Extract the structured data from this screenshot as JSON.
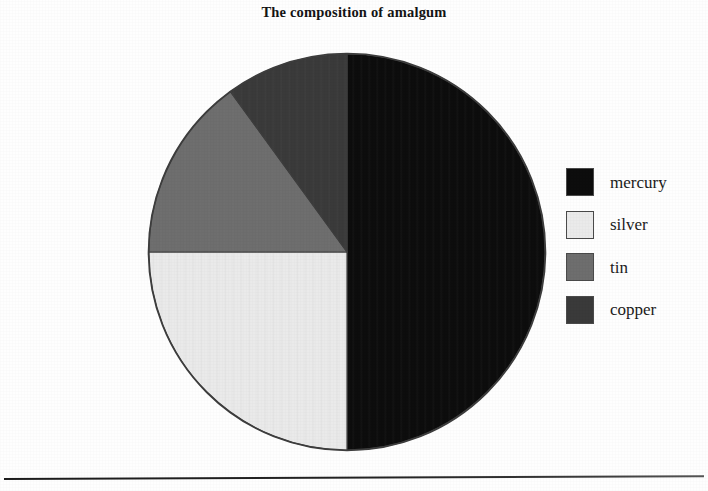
{
  "title": "The composition of amalgum",
  "chart_data": {
    "type": "pie",
    "title": "The composition of amalgum",
    "xlabel": "",
    "ylabel": "",
    "legend_position": "right",
    "grid": false,
    "start_angle_deg": 0,
    "direction": "clockwise",
    "categories": [
      "mercury",
      "silver",
      "tin",
      "copper"
    ],
    "values": [
      50,
      25,
      15,
      10
    ],
    "unit": "%",
    "colors": [
      "#0d0d0d",
      "#eaeaea",
      "#6e6e6e",
      "#3a3a3a"
    ],
    "slices": [
      {
        "label": "mercury",
        "value": 50,
        "color": "#0d0d0d",
        "start_deg": 0,
        "end_deg": 180
      },
      {
        "label": "silver",
        "value": 25,
        "color": "#eaeaea",
        "start_deg": 180,
        "end_deg": 270
      },
      {
        "label": "tin",
        "value": 15,
        "color": "#6e6e6e",
        "start_deg": 270,
        "end_deg": 324
      },
      {
        "label": "copper",
        "value": 10,
        "color": "#3a3a3a",
        "start_deg": 324,
        "end_deg": 360
      }
    ]
  },
  "legend": {
    "items": [
      {
        "label": "mercury",
        "color": "#0d0d0d"
      },
      {
        "label": "silver",
        "color": "#eaeaea"
      },
      {
        "label": "tin",
        "color": "#6e6e6e"
      },
      {
        "label": "copper",
        "color": "#3a3a3a"
      }
    ]
  },
  "footer": {
    "rule": "horizontal-rule"
  }
}
